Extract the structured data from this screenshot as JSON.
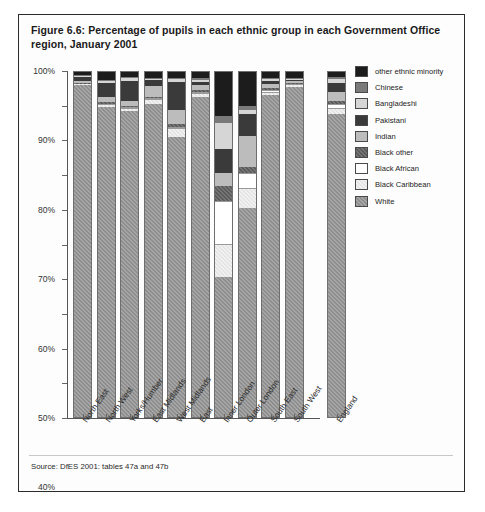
{
  "figure": {
    "title": "Figure 6.6: Percentage of pupils in each ethnic group in each Government Office region, January 2001",
    "source": "Source: DfES 2001: tables 47a and 47b"
  },
  "legend": {
    "position": "right",
    "entries": [
      {
        "label": "other ethnic minority",
        "color": "#1c1c1c",
        "key": "other_ethnic_minority"
      },
      {
        "label": "Chinese",
        "color": "#7a7a7a",
        "key": "chinese"
      },
      {
        "label": "Bangladeshi",
        "color": "#d6d6d6",
        "key": "bangladeshi"
      },
      {
        "label": "Pakistani",
        "color": "#3a3a3a",
        "key": "pakistani"
      },
      {
        "label": "Indian",
        "color": "#bcbcbc",
        "key": "indian"
      },
      {
        "label": "Black other",
        "color": "#5a5a5a",
        "key": "black_other"
      },
      {
        "label": "Black African",
        "color": "#ffffff",
        "key": "black_african"
      },
      {
        "label": "Black Caribbean",
        "color": "#e4e4e4",
        "key": "black_caribbean"
      },
      {
        "label": "White",
        "color": "#8d8d8d",
        "key": "white"
      }
    ]
  },
  "axes": {
    "y_ticks": [
      "100%",
      "90%",
      "80%",
      "70%",
      "60%",
      "50%",
      "40%",
      "30%",
      "20%",
      "10%",
      "0%"
    ],
    "y_values": [
      100,
      90,
      80,
      70,
      60,
      50,
      40,
      30,
      20,
      10,
      0
    ]
  },
  "chart_data": {
    "type": "bar",
    "title": "Figure 6.6: Percentage of pupils in each ethnic group in each Government Office region, January 2001",
    "subtitle": "",
    "xlabel": "",
    "ylabel": "",
    "ylim": [
      0,
      100
    ],
    "grid": false,
    "stacked": true,
    "legend_position": "right",
    "categories": [
      "North East",
      "North West",
      "Yorks/Humber",
      "East Midlands",
      "West Midlands",
      "East",
      "Inner London",
      "Outer London",
      "South East",
      "South West",
      "England"
    ],
    "series": [
      {
        "name": "White",
        "color": "#8d8d8d",
        "values": [
          96.0,
          89.5,
          88.5,
          90.5,
          81.0,
          92.5,
          40.5,
          60.5,
          93.0,
          95.5,
          87.5
        ]
      },
      {
        "name": "Black Caribbean",
        "color": "#e4e4e4",
        "values": [
          0.2,
          0.6,
          0.6,
          1.2,
          2.3,
          0.8,
          9.5,
          5.5,
          0.8,
          0.4,
          1.5
        ]
      },
      {
        "name": "Black African",
        "color": "#ffffff",
        "values": [
          0.2,
          0.5,
          0.5,
          0.5,
          0.7,
          0.7,
          12.5,
          4.5,
          0.7,
          0.3,
          1.6
        ]
      },
      {
        "name": "Black other",
        "color": "#5a5a5a",
        "values": [
          0.2,
          0.4,
          0.4,
          0.4,
          0.7,
          0.4,
          4.5,
          1.7,
          0.5,
          0.3,
          0.8
        ]
      },
      {
        "name": "Indian",
        "color": "#bcbcbc",
        "values": [
          0.5,
          1.6,
          1.4,
          3.0,
          4.0,
          1.6,
          3.5,
          9.0,
          1.3,
          0.5,
          2.6
        ]
      },
      {
        "name": "Pakistani",
        "color": "#3a3a3a",
        "values": [
          1.1,
          4.0,
          5.8,
          1.8,
          8.0,
          0.8,
          7.0,
          6.3,
          0.9,
          0.4,
          2.6
        ]
      },
      {
        "name": "Bangladeshi",
        "color": "#d6d6d6",
        "values": [
          0.3,
          0.5,
          0.7,
          0.3,
          1.0,
          0.7,
          7.5,
          1.3,
          0.5,
          0.3,
          1.0
        ]
      },
      {
        "name": "Chinese",
        "color": "#7a7a7a",
        "values": [
          0.3,
          0.4,
          0.4,
          0.4,
          0.4,
          0.5,
          2.0,
          1.2,
          0.4,
          0.4,
          0.6
        ]
      },
      {
        "name": "other ethnic minority",
        "color": "#1c1c1c",
        "values": [
          1.2,
          2.5,
          1.7,
          1.9,
          1.9,
          2.0,
          13.0,
          10.0,
          1.9,
          1.9,
          1.8
        ]
      }
    ]
  }
}
